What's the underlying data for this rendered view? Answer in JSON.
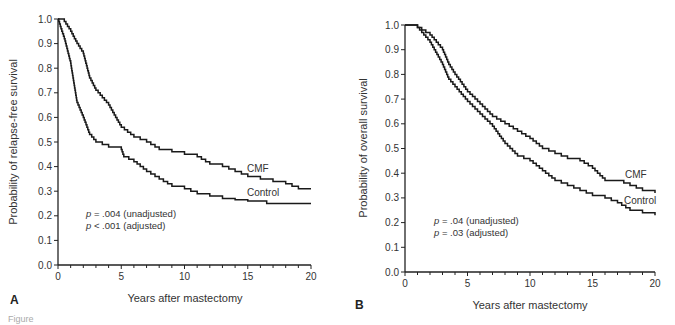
{
  "chart_data": [
    {
      "type": "line",
      "panel": "A",
      "title": "",
      "xlabel": "Years after mastectomy",
      "ylabel": "Probability of relapse-free survival",
      "xlim": [
        0,
        20
      ],
      "ylim": [
        0.0,
        1.0
      ],
      "xticks": [
        "0",
        "5",
        "10",
        "15",
        "20"
      ],
      "yticks": [
        "0.0",
        "0.1",
        "0.2",
        "0.3",
        "0.4",
        "0.5",
        "0.6",
        "0.7",
        "0.8",
        "0.9",
        "1.0"
      ],
      "grid": false,
      "series": [
        {
          "name": "CMF",
          "x": [
            0,
            0.5,
            1,
            1.5,
            2,
            2.5,
            3,
            4,
            5,
            6,
            7,
            8,
            9,
            10,
            11,
            12,
            13,
            14,
            15,
            16,
            17,
            18,
            19,
            20
          ],
          "values": [
            1.0,
            0.99,
            0.95,
            0.9,
            0.86,
            0.76,
            0.71,
            0.65,
            0.56,
            0.52,
            0.5,
            0.47,
            0.46,
            0.45,
            0.44,
            0.41,
            0.4,
            0.38,
            0.36,
            0.35,
            0.34,
            0.33,
            0.31,
            0.31
          ]
        },
        {
          "name": "Control",
          "x": [
            0,
            0.3,
            0.5,
            1,
            1.5,
            2,
            2.5,
            3,
            4,
            5,
            5.2,
            6,
            7,
            8,
            9,
            10,
            11,
            12,
            13,
            14,
            15,
            16.5,
            20
          ],
          "values": [
            1.0,
            0.95,
            0.92,
            0.82,
            0.66,
            0.6,
            0.53,
            0.5,
            0.48,
            0.47,
            0.44,
            0.42,
            0.38,
            0.35,
            0.32,
            0.31,
            0.29,
            0.28,
            0.27,
            0.265,
            0.26,
            0.25,
            0.25
          ]
        }
      ],
      "annotations": [
        "p = .004 (unadjusted)",
        "p < .001 (adjusted)"
      ]
    },
    {
      "type": "line",
      "panel": "B",
      "title": "",
      "xlabel": "Years after mastectomy",
      "ylabel": "Probability of overall survival",
      "xlim": [
        0,
        20
      ],
      "ylim": [
        0.0,
        1.0
      ],
      "xticks": [
        "0",
        "5",
        "10",
        "15",
        "20"
      ],
      "yticks": [
        "0.0",
        "0.1",
        "0.2",
        "0.3",
        "0.4",
        "0.5",
        "0.6",
        "0.7",
        "0.8",
        "0.9",
        "1.0"
      ],
      "grid": false,
      "series": [
        {
          "name": "CMF",
          "x": [
            0,
            1,
            2,
            3,
            3.5,
            4,
            5,
            6,
            7,
            8,
            9,
            10,
            11,
            12,
            13,
            14,
            15,
            16,
            17,
            18,
            19,
            20
          ],
          "values": [
            1.0,
            0.99,
            0.96,
            0.9,
            0.84,
            0.8,
            0.73,
            0.68,
            0.63,
            0.6,
            0.57,
            0.54,
            0.5,
            0.48,
            0.46,
            0.45,
            0.42,
            0.37,
            0.37,
            0.35,
            0.33,
            0.32
          ]
        },
        {
          "name": "Control",
          "x": [
            0,
            1,
            2,
            3,
            3.5,
            4,
            5,
            6,
            7,
            8,
            9,
            10,
            11,
            12,
            13,
            14,
            15,
            16,
            17,
            18,
            19,
            20
          ],
          "values": [
            1.0,
            0.99,
            0.93,
            0.84,
            0.78,
            0.75,
            0.69,
            0.64,
            0.59,
            0.52,
            0.47,
            0.45,
            0.41,
            0.37,
            0.35,
            0.33,
            0.31,
            0.3,
            0.28,
            0.25,
            0.24,
            0.23
          ]
        }
      ],
      "annotations": [
        "p = .04 (unadjusted)",
        "p = .03 (adjusted)"
      ]
    }
  ],
  "panels": {
    "a": {
      "letter": "A",
      "xlabel": "Years after mastectomy",
      "ylabel": "Probability of relapse-free survival",
      "label_cmf": "CMF",
      "label_control": "Control",
      "annot1_p": "p",
      "annot1_rest": " = .004 (unadjusted)",
      "annot2_p": "p",
      "annot2_rest": " < .001 (adjusted)"
    },
    "b": {
      "letter": "B",
      "xlabel": "Years after mastectomy",
      "ylabel": "Probability of overall survival",
      "label_cmf": "CMF",
      "label_control": "Control",
      "annot1_p": "p",
      "annot1_rest": " = .04 (unadjusted)",
      "annot2_p": "p",
      "annot2_rest": " = .03 (adjusted)"
    }
  },
  "caption_fragment": "Figure"
}
